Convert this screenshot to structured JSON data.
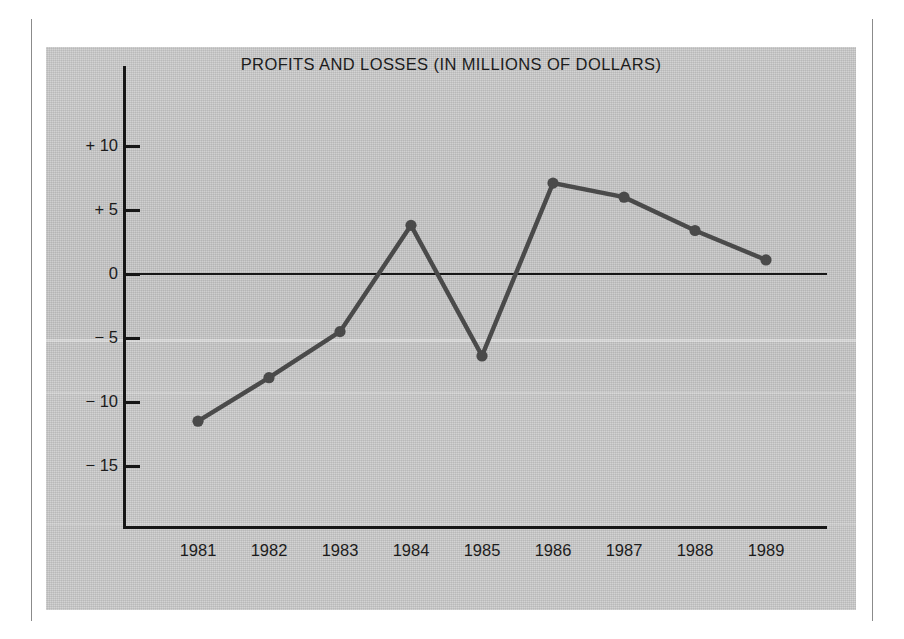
{
  "chart_data": {
    "type": "line",
    "title": "PROFITS AND LOSSES (IN MILLIONS OF DOLLARS)",
    "xlabel": "",
    "ylabel": "",
    "categories": [
      "1981",
      "1982",
      "1983",
      "1984",
      "1985",
      "1986",
      "1987",
      "1988",
      "1989"
    ],
    "values": [
      -11.5,
      -8.1,
      -4.5,
      3.8,
      -6.4,
      7.1,
      6.0,
      3.4,
      1.1
    ],
    "series": [
      {
        "name": "Profits and losses",
        "values": [
          -11.5,
          -8.1,
          -4.5,
          3.8,
          -6.4,
          7.1,
          6.0,
          3.4,
          1.1
        ]
      }
    ],
    "ylim": [
      -17.5,
      12.5
    ],
    "yticks": [
      10,
      5,
      0,
      -5,
      -10,
      -15
    ],
    "ytick_labels": [
      "+ 10",
      "+ 5",
      "0",
      "− 5",
      "− 10",
      "− 15"
    ],
    "grid": false,
    "legend": false,
    "legend_position": "none",
    "markers": true,
    "zero_line": true,
    "line_color": "#4a4a4a",
    "marker_color": "#4a4a4a",
    "axis_color": "#161616",
    "panel_color": "#c9c9c9",
    "text_color": "#1c1c1c"
  },
  "axis": {
    "y_labels": [
      {
        "text": "+ 10",
        "value": 10
      },
      {
        "text": "+ 5",
        "value": 5
      },
      {
        "text": "0",
        "value": 0
      },
      {
        "text": "− 5",
        "value": -5
      },
      {
        "text": "− 10",
        "value": -10
      },
      {
        "text": "− 15",
        "value": -15
      }
    ],
    "x_labels": [
      {
        "text": "1981"
      },
      {
        "text": "1982"
      },
      {
        "text": "1983"
      },
      {
        "text": "1984"
      },
      {
        "text": "1985"
      },
      {
        "text": "1986"
      },
      {
        "text": "1987"
      },
      {
        "text": "1988"
      },
      {
        "text": "1989"
      }
    ]
  }
}
